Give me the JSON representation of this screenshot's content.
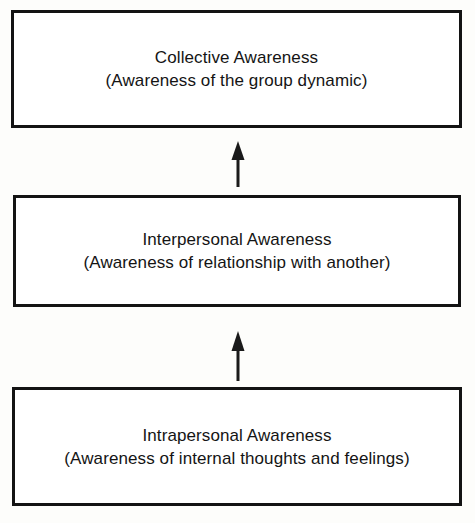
{
  "diagram": {
    "orientation": "vertical-bottom-up",
    "background_color": "#fdfdfb",
    "border_color": "#131313",
    "text_color": "#141414",
    "tiers": [
      {
        "id": "collective",
        "level": 3,
        "position": "top",
        "title": "Collective Awareness",
        "subtitle": "(Awareness of the group dynamic)"
      },
      {
        "id": "interpersonal",
        "level": 2,
        "position": "middle",
        "title": "Interpersonal Awareness",
        "subtitle": "(Awareness of relationship with another)"
      },
      {
        "id": "intrapersonal",
        "level": 1,
        "position": "bottom",
        "title": "Intrapersonal Awareness",
        "subtitle": "(Awareness of internal thoughts and feelings)"
      }
    ],
    "connectors": [
      {
        "id": "intrapersonal-to-interpersonal",
        "icon": "arrow-up-icon",
        "direction": "up",
        "from": "intrapersonal",
        "to": "interpersonal"
      },
      {
        "id": "interpersonal-to-collective",
        "icon": "arrow-up-icon",
        "direction": "up",
        "from": "interpersonal",
        "to": "collective"
      }
    ]
  }
}
